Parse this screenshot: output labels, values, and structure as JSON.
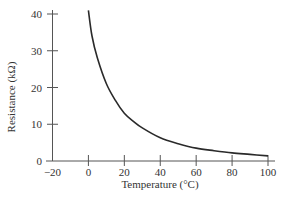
{
  "chart_data": {
    "type": "line",
    "title": "",
    "xlabel": "Temperature (°C)",
    "ylabel": "Resistance (kΩ)",
    "xlim": [
      -20,
      100
    ],
    "ylim": [
      0,
      42
    ],
    "x_ticks": [
      -20,
      0,
      20,
      40,
      60,
      80,
      100
    ],
    "y_ticks": [
      0,
      10,
      20,
      30,
      40
    ],
    "grid": false,
    "legend": null,
    "series": [
      {
        "name": "Thermistor resistance",
        "x": [
          0,
          2,
          5,
          10,
          15,
          20,
          25,
          30,
          40,
          50,
          60,
          70,
          80,
          90,
          100
        ],
        "values": [
          41,
          34,
          28,
          21,
          16.5,
          13,
          10.8,
          9,
          6.3,
          4.7,
          3.5,
          2.8,
          2.2,
          1.8,
          1.4
        ]
      }
    ]
  }
}
